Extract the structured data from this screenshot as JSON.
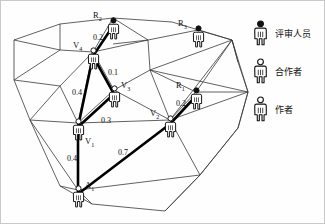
{
  "figure": {
    "type": "academic-network-diagram"
  },
  "nodes": [
    {
      "id": "R2",
      "label": "R",
      "sub": "2",
      "role": "reviewer",
      "icon": "person-filled-head-icon",
      "x": 113,
      "y": 22
    },
    {
      "id": "R3",
      "label": "R",
      "sub": "3",
      "role": "reviewer",
      "icon": "person-filled-head-icon",
      "x": 198,
      "y": 30
    },
    {
      "id": "R1",
      "label": "R",
      "sub": "1",
      "role": "reviewer",
      "icon": "person-filled-head-icon",
      "x": 196,
      "y": 92
    },
    {
      "id": "V4",
      "label": "V",
      "sub": "4",
      "role": "collaborator",
      "icon": "person-hollow-head-icon",
      "x": 93,
      "y": 52
    },
    {
      "id": "V3",
      "label": "V",
      "sub": "3",
      "role": "collaborator",
      "icon": "person-hollow-head-icon",
      "x": 114,
      "y": 90
    },
    {
      "id": "V2",
      "label": "V",
      "sub": "2",
      "role": "collaborator",
      "icon": "person-hollow-head-icon",
      "x": 170,
      "y": 120
    },
    {
      "id": "V1",
      "label": "V",
      "sub": "1",
      "role": "collaborator",
      "icon": "person-hollow-head-icon",
      "x": 78,
      "y": 123
    },
    {
      "id": "A1",
      "label": "A",
      "sub": "1",
      "role": "author",
      "icon": "person-hollow-head-icon",
      "x": 78,
      "y": 190
    }
  ],
  "edges": [
    {
      "id": "e-v4-r2",
      "from": "V4",
      "to": "R2",
      "weight": "0.2",
      "wx": 93,
      "wy": 34
    },
    {
      "id": "e-v4-v3",
      "from": "V4",
      "to": "V3",
      "weight": "0.1",
      "wx": 108,
      "wy": 69
    },
    {
      "id": "e-v4-v1",
      "from": "V4",
      "to": "V1",
      "weight": "0.4",
      "wx": 72,
      "wy": 89
    },
    {
      "id": "e-v3-v1",
      "from": "V3",
      "to": "V1",
      "weight": "0.3",
      "wx": 101,
      "wy": 117
    },
    {
      "id": "e-v2-r1",
      "from": "V2",
      "to": "R1",
      "weight": "0.2",
      "wx": 176,
      "wy": 100
    },
    {
      "id": "e-a1-v1",
      "from": "A1",
      "to": "V1",
      "weight": "0.4",
      "wx": 67,
      "wy": 155
    },
    {
      "id": "e-a1-v2",
      "from": "A1",
      "to": "V2",
      "weight": "0.7",
      "wx": 118,
      "wy": 149
    }
  ],
  "legend": {
    "items": [
      {
        "id": "legend-reviewer",
        "icon": "person-filled-head-icon",
        "label": "评审人员"
      },
      {
        "id": "legend-collaborator",
        "icon": "person-hollow-head-icon",
        "label": "合作者"
      },
      {
        "id": "legend-author",
        "icon": "person-hollow-head-icon",
        "label": "作者"
      }
    ]
  },
  "colors": {
    "ink": "#111111",
    "mesh": "#3a3a3a",
    "frame": "#c9c9c9",
    "highlight": "#000000"
  }
}
